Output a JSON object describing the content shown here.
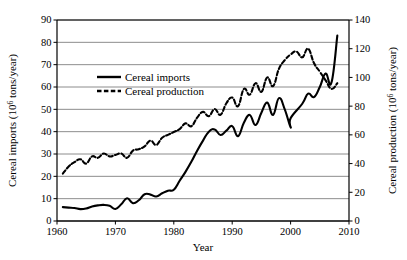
{
  "chart_data": {
    "type": "line",
    "title": "",
    "xlabel": "Year",
    "ylabel": "Cereal imports (10⁶ tons/year)",
    "y2label": "Cereal production (10⁶ tons/year)",
    "xlim": [
      1960,
      2010
    ],
    "ylim": [
      0,
      90
    ],
    "y2lim": [
      0,
      140
    ],
    "xticks": [
      1960,
      1970,
      1980,
      1990,
      2000,
      2010
    ],
    "yticks": [
      0,
      10,
      20,
      30,
      40,
      50,
      60,
      70,
      80,
      90
    ],
    "y2ticks": [
      0,
      20,
      40,
      60,
      80,
      100,
      120,
      140
    ],
    "grid": "horizontal",
    "legend_position": "upper-left-inside",
    "series": [
      {
        "name": "Cereal imports",
        "axis": "left",
        "style": "solid",
        "color": "#000000",
        "x": [
          1961,
          1962,
          1963,
          1964,
          1965,
          1966,
          1967,
          1968,
          1969,
          1970,
          1971,
          1972,
          1973,
          1974,
          1975,
          1976,
          1977,
          1978,
          1979,
          1980,
          1981,
          1982,
          1983,
          1984,
          1985,
          1986,
          1987,
          1988,
          1989,
          1990,
          1991,
          1992,
          1993,
          1994,
          1995,
          1996,
          1997,
          1998,
          1999,
          2000,
          1901,
          2002,
          2003,
          2004,
          2005,
          2006,
          2007,
          2008
        ],
        "values": [
          6.2,
          6.0,
          5.8,
          5.3,
          5.6,
          6.5,
          7.0,
          7.2,
          6.8,
          5.4,
          7.5,
          10.2,
          8.0,
          9.3,
          12.0,
          11.8,
          11.0,
          12.4,
          13.6,
          14.0,
          18.0,
          22.0,
          26.5,
          31.5,
          36.0,
          40.0,
          41.0,
          38.5,
          40.5,
          42.5,
          38.0,
          44.0,
          47.5,
          43.0,
          48.5,
          53.0,
          47.5,
          55.0,
          50.0,
          42.0,
          46.0,
          52.5,
          57.0,
          55.5,
          60.0,
          66.0,
          62.0,
          83.0
        ]
      },
      {
        "name": "Cereal production",
        "axis": "right",
        "style": "dashed",
        "color": "#000000",
        "x": [
          1961,
          1962,
          1963,
          1964,
          1965,
          1966,
          1967,
          1968,
          1969,
          1970,
          1971,
          1972,
          1973,
          1974,
          1975,
          1976,
          1977,
          1978,
          1979,
          1980,
          1981,
          1982,
          1983,
          1984,
          1985,
          1986,
          1987,
          1988,
          1989,
          1990,
          1991,
          1992,
          1993,
          1994,
          1995,
          1996,
          1997,
          1998,
          1999,
          2000,
          2001,
          2002,
          2003,
          2004,
          2005,
          2006,
          2007,
          2008
        ],
        "values": [
          33,
          38,
          41,
          43,
          40,
          45,
          44,
          47,
          45,
          46,
          47,
          44,
          49,
          50,
          52,
          56,
          53,
          58,
          60,
          62,
          64,
          68,
          66,
          72,
          76,
          73,
          78,
          74,
          82,
          86,
          80,
          92,
          88,
          96,
          90,
          100,
          94,
          106,
          112,
          116,
          118,
          114,
          120,
          110,
          104,
          98,
          92,
          96
        ]
      }
    ],
    "legend": [
      {
        "label": "Cereal imports",
        "style": "solid"
      },
      {
        "label": "Cereal production",
        "style": "dashed"
      }
    ]
  }
}
